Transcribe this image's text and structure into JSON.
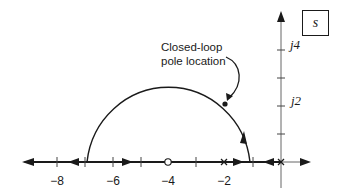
{
  "figure": {
    "plane_label": "s",
    "annotation": {
      "line1": "Closed-loop",
      "line2": "pole location"
    },
    "real_axis_ticks": [
      {
        "value": -8,
        "label": "−8"
      },
      {
        "value": -6,
        "label": "−6"
      },
      {
        "value": -4,
        "label": "−4"
      },
      {
        "value": -2,
        "label": "−2"
      }
    ],
    "imag_axis_ticks": [
      {
        "value": 2,
        "label": "j2"
      },
      {
        "value": 4,
        "label": "j4"
      }
    ],
    "open_loop_poles": [
      {
        "re": 0,
        "im": 0
      },
      {
        "re": -2,
        "im": 0
      }
    ],
    "open_loop_zeros": [
      {
        "re": -4,
        "im": 0
      }
    ],
    "root_locus_circle": {
      "center_re": -4,
      "radius": 3
    },
    "closed_loop_pole": {
      "re": -2,
      "im": 2.1
    },
    "colors": {
      "ink": "#1a1a1a",
      "axis": "#555555",
      "background": "#ffffff"
    }
  }
}
